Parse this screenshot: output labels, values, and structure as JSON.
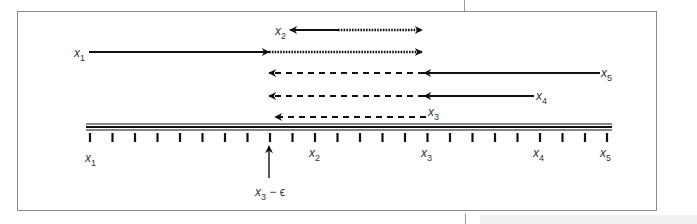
{
  "figure": {
    "colors": {
      "line": "#111111",
      "frame": "#8c8c8c",
      "text": "#333333",
      "background": "#ffffff"
    },
    "timeline": {
      "tick_count": 24,
      "labels": [
        {
          "var": "x",
          "sub": "1",
          "tick_index": 0
        },
        {
          "var": "x",
          "sub": "2",
          "tick_index": 10
        },
        {
          "var": "x",
          "sub": "3",
          "tick_index": 15
        },
        {
          "var": "x",
          "sub": "4",
          "tick_index": 20
        },
        {
          "var": "x",
          "sub": "5",
          "tick_index": 23
        }
      ]
    },
    "pointer": {
      "label_var": "x",
      "label_sub": "3",
      "label_suffix": " − ϵ"
    },
    "arrows": [
      {
        "label_var": "x",
        "label_sub": "2",
        "solid": "leftward from midpoint to x3 − ϵ",
        "dotted": "rightward to x3",
        "row": 1
      },
      {
        "label_var": "x",
        "label_sub": "1",
        "solid": "from x1 to x3 − ϵ",
        "dotted": "to x3",
        "row": 2
      },
      {
        "label_var": "x",
        "label_sub": "5",
        "solid": "from x5 to x3",
        "dashed": "to x3 − ϵ",
        "row": 3
      },
      {
        "label_var": "x",
        "label_sub": "4",
        "solid": "from x4 to x3",
        "dashed": "to x3 − ϵ",
        "row": 4
      },
      {
        "label_var": "x",
        "label_sub": "3",
        "dashed": "from x3 to x3 − ϵ",
        "row": 5
      }
    ]
  }
}
